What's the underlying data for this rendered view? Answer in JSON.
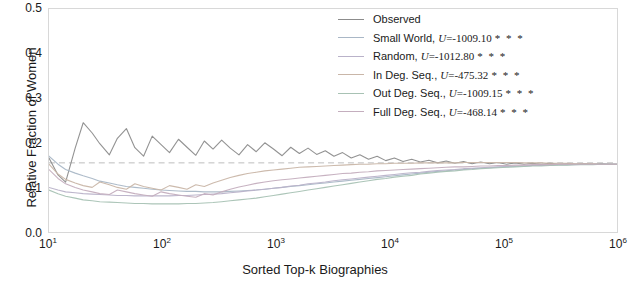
{
  "chart_data": {
    "type": "line",
    "title": "",
    "xlabel": "Sorted Top-k Biographies",
    "ylabel": "Relative Fraction of Women",
    "xscale": "log",
    "xlim": [
      10,
      1000000
    ],
    "ylim": [
      0.0,
      0.5
    ],
    "grid": false,
    "legend_position": "top-right",
    "xticks": [
      {
        "value": 10,
        "label": "10",
        "exp": "1"
      },
      {
        "value": 100,
        "label": "10",
        "exp": "2"
      },
      {
        "value": 1000,
        "label": "10",
        "exp": "3"
      },
      {
        "value": 10000,
        "label": "10",
        "exp": "4"
      },
      {
        "value": 100000,
        "label": "10",
        "exp": "5"
      },
      {
        "value": 1000000,
        "label": "10",
        "exp": "6"
      }
    ],
    "yticks": [
      "0.0",
      "0.1",
      "0.2",
      "0.3",
      "0.4",
      "0.5"
    ],
    "reference_line": {
      "name": "baseline",
      "value": 0.155,
      "style": "dashed",
      "color": "#7f7f7f"
    },
    "series": [
      {
        "name": "Observed",
        "color": "#8c8c8c",
        "legend_label": "Observed",
        "stat_symbol": "",
        "stat_value": "",
        "significance": "",
        "x": [
          10,
          12,
          14,
          17,
          20,
          24,
          28,
          34,
          40,
          48,
          57,
          68,
          81,
          97,
          115,
          138,
          164,
          196,
          233,
          278,
          331,
          394,
          470,
          560,
          667,
          794,
          946,
          1127,
          1343,
          1600,
          1906,
          2271,
          2705,
          3223,
          3840,
          4575,
          5450,
          6493,
          7736,
          9216,
          10980,
          13081,
          15583,
          18563,
          22114,
          26344,
          31383,
          37388,
          44542,
          53060,
          63213,
          75308,
          89716,
          106874,
          127320,
          151676,
          180687,
          215238,
          256425,
          305466,
          363838,
          433412,
          516263,
          615057,
          732710,
          872726,
          1000000
        ],
        "y": [
          0.166,
          0.128,
          0.112,
          0.188,
          0.245,
          0.222,
          0.198,
          0.173,
          0.21,
          0.232,
          0.189,
          0.17,
          0.215,
          0.196,
          0.178,
          0.208,
          0.19,
          0.172,
          0.204,
          0.186,
          0.206,
          0.188,
          0.173,
          0.196,
          0.18,
          0.2,
          0.186,
          0.171,
          0.19,
          0.176,
          0.188,
          0.174,
          0.182,
          0.17,
          0.178,
          0.166,
          0.173,
          0.163,
          0.17,
          0.16,
          0.166,
          0.158,
          0.163,
          0.157,
          0.161,
          0.155,
          0.159,
          0.154,
          0.158,
          0.153,
          0.157,
          0.153,
          0.156,
          0.152,
          0.155,
          0.152,
          0.154,
          0.152,
          0.154,
          0.152,
          0.153,
          0.152,
          0.153,
          0.152,
          0.153,
          0.152,
          0.152
        ]
      },
      {
        "name": "Small World",
        "color": "#a9b7c6",
        "legend_label": "Small World",
        "stat_symbol": "U",
        "stat_value": "-1009.10",
        "significance": "***",
        "x": [
          10,
          12,
          14,
          17,
          20,
          24,
          28,
          34,
          40,
          48,
          57,
          68,
          81,
          97,
          115,
          138,
          164,
          196,
          233,
          278,
          331,
          394,
          470,
          560,
          667,
          794,
          946,
          1127,
          1343,
          1600,
          1906,
          2271,
          2705,
          3223,
          3840,
          4575,
          5450,
          6493,
          7736,
          9216,
          10980,
          13081,
          15583,
          18563,
          22114,
          26344,
          31383,
          37388,
          44542,
          53060,
          63213,
          75308,
          89716,
          106874,
          127320,
          151676,
          180687,
          215238,
          256425,
          305466,
          363838,
          433412,
          516263,
          615057,
          732710,
          872726,
          1000000
        ],
        "y": [
          0.17,
          0.152,
          0.14,
          0.132,
          0.126,
          0.12,
          0.114,
          0.11,
          0.106,
          0.102,
          0.1,
          0.098,
          0.096,
          0.094,
          0.093,
          0.092,
          0.091,
          0.091,
          0.09,
          0.09,
          0.09,
          0.091,
          0.092,
          0.093,
          0.094,
          0.096,
          0.098,
          0.1,
          0.102,
          0.104,
          0.106,
          0.108,
          0.11,
          0.112,
          0.114,
          0.116,
          0.118,
          0.12,
          0.122,
          0.124,
          0.126,
          0.128,
          0.13,
          0.132,
          0.134,
          0.136,
          0.137,
          0.139,
          0.14,
          0.142,
          0.143,
          0.144,
          0.145,
          0.146,
          0.147,
          0.148,
          0.149,
          0.149,
          0.15,
          0.151,
          0.151,
          0.152,
          0.152,
          0.152,
          0.152,
          0.152,
          0.152
        ]
      },
      {
        "name": "Random",
        "color": "#b9b2c9",
        "legend_label": "Random",
        "stat_symbol": "U",
        "stat_value": "-1012.80",
        "significance": "***",
        "x": [
          10,
          12,
          14,
          17,
          20,
          24,
          28,
          34,
          40,
          48,
          57,
          68,
          81,
          97,
          115,
          138,
          164,
          196,
          233,
          278,
          331,
          394,
          470,
          560,
          667,
          794,
          946,
          1127,
          1343,
          1600,
          1906,
          2271,
          2705,
          3223,
          3840,
          4575,
          5450,
          6493,
          7736,
          9216,
          10980,
          13081,
          15583,
          18563,
          22114,
          26344,
          31383,
          37388,
          44542,
          53060,
          63213,
          75308,
          89716,
          106874,
          127320,
          151676,
          180687,
          215238,
          256425,
          305466,
          363838,
          433412,
          516263,
          615057,
          732710,
          872726,
          1000000
        ],
        "y": [
          0.1,
          0.094,
          0.09,
          0.088,
          0.086,
          0.085,
          0.084,
          0.083,
          0.082,
          0.082,
          0.081,
          0.081,
          0.081,
          0.081,
          0.081,
          0.082,
          0.082,
          0.083,
          0.084,
          0.085,
          0.086,
          0.088,
          0.09,
          0.092,
          0.094,
          0.096,
          0.098,
          0.1,
          0.103,
          0.105,
          0.108,
          0.11,
          0.112,
          0.115,
          0.117,
          0.119,
          0.121,
          0.123,
          0.125,
          0.127,
          0.129,
          0.131,
          0.133,
          0.134,
          0.136,
          0.138,
          0.139,
          0.14,
          0.142,
          0.143,
          0.144,
          0.145,
          0.146,
          0.147,
          0.148,
          0.148,
          0.149,
          0.15,
          0.15,
          0.151,
          0.151,
          0.151,
          0.152,
          0.152,
          0.152,
          0.152,
          0.152
        ]
      },
      {
        "name": "In Deg. Seq.",
        "color": "#c9b6a8",
        "legend_label": "In Deg. Seq.",
        "stat_symbol": "U",
        "stat_value": "-475.32",
        "significance": "***",
        "x": [
          10,
          12,
          14,
          17,
          20,
          24,
          28,
          34,
          40,
          48,
          57,
          68,
          81,
          97,
          115,
          138,
          164,
          196,
          233,
          278,
          331,
          394,
          470,
          560,
          667,
          794,
          946,
          1127,
          1343,
          1600,
          1906,
          2271,
          2705,
          3223,
          3840,
          4575,
          5450,
          6493,
          7736,
          9216,
          10980,
          13081,
          15583,
          18563,
          22114,
          26344,
          31383,
          37388,
          44542,
          53060,
          63213,
          75308,
          89716,
          106874,
          127320,
          151676,
          180687,
          215238,
          256425,
          305466,
          363838,
          433412,
          516263,
          615057,
          732710,
          872726,
          1000000
        ],
        "y": [
          0.152,
          0.13,
          0.118,
          0.11,
          0.104,
          0.1,
          0.112,
          0.106,
          0.1,
          0.096,
          0.108,
          0.102,
          0.098,
          0.094,
          0.104,
          0.1,
          0.096,
          0.106,
          0.102,
          0.11,
          0.116,
          0.122,
          0.127,
          0.131,
          0.134,
          0.137,
          0.139,
          0.141,
          0.143,
          0.145,
          0.146,
          0.147,
          0.148,
          0.149,
          0.15,
          0.151,
          0.152,
          0.152,
          0.153,
          0.153,
          0.154,
          0.154,
          0.154,
          0.155,
          0.155,
          0.155,
          0.155,
          0.155,
          0.156,
          0.156,
          0.156,
          0.156,
          0.156,
          0.156,
          0.156,
          0.155,
          0.155,
          0.155,
          0.154,
          0.154,
          0.154,
          0.153,
          0.153,
          0.153,
          0.152,
          0.152,
          0.152
        ]
      },
      {
        "name": "Out Deg. Seq.",
        "color": "#a8c2b4",
        "legend_label": "Out Deg. Seq.",
        "stat_symbol": "U",
        "stat_value": "-1009.15",
        "significance": "***",
        "x": [
          10,
          12,
          14,
          17,
          20,
          24,
          28,
          34,
          40,
          48,
          57,
          68,
          81,
          97,
          115,
          138,
          164,
          196,
          233,
          278,
          331,
          394,
          470,
          560,
          667,
          794,
          946,
          1127,
          1343,
          1600,
          1906,
          2271,
          2705,
          3223,
          3840,
          4575,
          5450,
          6493,
          7736,
          9216,
          10980,
          13081,
          15583,
          18563,
          22114,
          26344,
          31383,
          37388,
          44542,
          53060,
          63213,
          75308,
          89716,
          106874,
          127320,
          151676,
          180687,
          215238,
          256425,
          305466,
          363838,
          433412,
          516263,
          615057,
          732710,
          872726,
          1000000
        ],
        "y": [
          0.094,
          0.086,
          0.08,
          0.076,
          0.072,
          0.07,
          0.068,
          0.067,
          0.066,
          0.065,
          0.064,
          0.064,
          0.063,
          0.063,
          0.063,
          0.063,
          0.064,
          0.064,
          0.065,
          0.066,
          0.068,
          0.07,
          0.072,
          0.074,
          0.076,
          0.079,
          0.082,
          0.085,
          0.088,
          0.091,
          0.094,
          0.097,
          0.1,
          0.103,
          0.106,
          0.109,
          0.112,
          0.115,
          0.118,
          0.12,
          0.123,
          0.125,
          0.127,
          0.13,
          0.132,
          0.134,
          0.136,
          0.137,
          0.139,
          0.14,
          0.142,
          0.143,
          0.144,
          0.145,
          0.146,
          0.147,
          0.148,
          0.148,
          0.149,
          0.15,
          0.15,
          0.151,
          0.151,
          0.151,
          0.152,
          0.152,
          0.152
        ]
      },
      {
        "name": "Full Deg. Seq.",
        "color": "#c4aebe",
        "legend_label": "Full Deg. Seq.",
        "stat_symbol": "U",
        "stat_value": "-468.14",
        "significance": "***",
        "x": [
          10,
          12,
          14,
          17,
          20,
          24,
          28,
          34,
          40,
          48,
          57,
          68,
          81,
          97,
          115,
          138,
          164,
          196,
          233,
          278,
          331,
          394,
          470,
          560,
          667,
          794,
          946,
          1127,
          1343,
          1600,
          1906,
          2271,
          2705,
          3223,
          3840,
          4575,
          5450,
          6493,
          7736,
          9216,
          10980,
          13081,
          15583,
          18563,
          22114,
          26344,
          31383,
          37388,
          44542,
          53060,
          63213,
          75308,
          89716,
          106874,
          127320,
          151676,
          180687,
          215238,
          256425,
          305466,
          363838,
          433412,
          516263,
          615057,
          732710,
          872726,
          1000000
        ],
        "y": [
          0.14,
          0.12,
          0.108,
          0.1,
          0.094,
          0.09,
          0.086,
          0.084,
          0.094,
          0.09,
          0.086,
          0.083,
          0.08,
          0.09,
          0.086,
          0.083,
          0.08,
          0.078,
          0.086,
          0.083,
          0.09,
          0.096,
          0.101,
          0.105,
          0.109,
          0.112,
          0.115,
          0.117,
          0.119,
          0.121,
          0.123,
          0.125,
          0.127,
          0.129,
          0.131,
          0.132,
          0.134,
          0.135,
          0.137,
          0.138,
          0.139,
          0.14,
          0.141,
          0.142,
          0.143,
          0.144,
          0.145,
          0.146,
          0.146,
          0.147,
          0.148,
          0.148,
          0.149,
          0.149,
          0.15,
          0.15,
          0.151,
          0.151,
          0.151,
          0.152,
          0.152,
          0.152,
          0.152,
          0.152,
          0.152,
          0.152,
          0.152
        ]
      }
    ]
  }
}
